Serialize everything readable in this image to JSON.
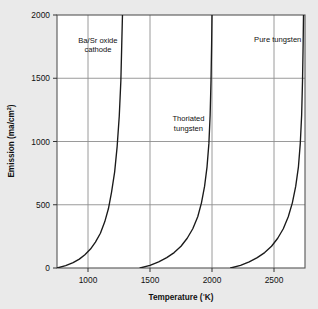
{
  "chart_data": {
    "type": "line",
    "title": "",
    "xlabel": "Temperature (°K)",
    "ylabel": "Emission (ma/cm²)",
    "ylabel_main": "Emission  (ma/cm",
    "ylabel_sup": "2",
    "ylabel_tail": ")",
    "xlabel_main": "Temperature  (",
    "xlabel_deg": "°",
    "xlabel_tail": "K)",
    "xlim": [
      750,
      2750
    ],
    "ylim": [
      0,
      2000
    ],
    "grid": true,
    "legend": "inline-annotations",
    "xticks": [
      1000,
      1500,
      2000,
      2500
    ],
    "xtick_labels": [
      "1000",
      "1500",
      "2000",
      "2500"
    ],
    "yticks": [
      0,
      500,
      1000,
      1500,
      2000
    ],
    "ytick_labels": [
      "0",
      "500",
      "1000",
      "1500",
      "2000"
    ],
    "series": [
      {
        "name": "Ba/Sr oxide cathode",
        "label_line1": "Ba/Sr  oxide",
        "label_line2": "cathode",
        "color": "#1a1a1a",
        "x": [
          750,
          820,
          880,
          930,
          975,
          1020,
          1060,
          1100,
          1135,
          1165,
          1190,
          1215,
          1235,
          1252,
          1265,
          1272,
          1278
        ],
        "y": [
          0,
          18,
          42,
          70,
          105,
          150,
          205,
          275,
          365,
          470,
          600,
          760,
          960,
          1200,
          1480,
          1760,
          2000
        ]
      },
      {
        "name": "Thoriated tungsten",
        "label_line1": "Thoriated",
        "label_line2": "tungsten",
        "color": "#1a1a1a",
        "x": [
          1420,
          1500,
          1570,
          1635,
          1695,
          1750,
          1800,
          1845,
          1885,
          1915,
          1940,
          1960,
          1975,
          1985,
          1992,
          1997,
          2000
        ],
        "y": [
          0,
          20,
          48,
          82,
          122,
          172,
          235,
          310,
          405,
          515,
          645,
          800,
          985,
          1210,
          1480,
          1770,
          2000
        ]
      },
      {
        "name": "Pure tungsten",
        "label_line1": "Pure  tungsten",
        "label_line2": "",
        "color": "#1a1a1a",
        "x": [
          2150,
          2230,
          2300,
          2365,
          2425,
          2480,
          2530,
          2575,
          2615,
          2648,
          2675,
          2697,
          2712,
          2723,
          2730,
          2735,
          2738
        ],
        "y": [
          0,
          20,
          48,
          82,
          122,
          172,
          235,
          310,
          405,
          515,
          645,
          800,
          985,
          1210,
          1480,
          1770,
          2000
        ]
      }
    ],
    "annotations": [
      {
        "text": "Ba/Sr oxide cathode",
        "x": 1080,
        "y": 1780
      },
      {
        "text": "Thoriated tungsten",
        "x": 1810,
        "y": 1160
      },
      {
        "text": "Pure tungsten",
        "x": 2530,
        "y": 1790
      }
    ],
    "style": {
      "grid_color": "#8e8e8e",
      "frame_color": "#555555",
      "curve_color": "#1a1a1a",
      "plot_background": "#ffffff",
      "page_background": "#eaeaea",
      "text_color": "#111111"
    }
  }
}
